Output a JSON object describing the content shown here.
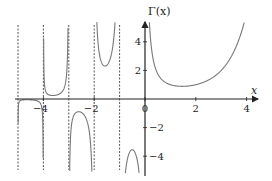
{
  "chart_data": {
    "type": "line",
    "title": "",
    "function": "Gamma function",
    "xlabel": "x",
    "ylabel": "Γ(x)",
    "x_ticks": [
      -4,
      -2,
      0,
      2,
      4
    ],
    "x_tick_labels": [
      "−4",
      "−2",
      "0",
      "2",
      "4"
    ],
    "y_ticks": [
      4,
      2,
      -2,
      -4
    ],
    "y_tick_labels": [
      "4",
      "2",
      "−2",
      "−4"
    ],
    "xlim": [
      -5,
      4.4
    ],
    "ylim": [
      -5,
      5.5
    ],
    "grid": false,
    "legend": null,
    "asymptotes_x": [
      -5,
      -4,
      -3,
      -2,
      -1
    ],
    "series": [
      {
        "name": "Γ(x), x > 0",
        "points": [
          [
            0.2,
            4.59
          ],
          [
            0.3,
            2.99
          ],
          [
            0.5,
            1.77
          ],
          [
            1.0,
            1.0
          ],
          [
            1.46,
            0.886
          ],
          [
            2.0,
            1.0
          ],
          [
            3.0,
            2.0
          ],
          [
            3.5,
            3.32
          ],
          [
            4.0,
            6.0
          ]
        ]
      },
      {
        "name": "Γ(x), -1 < x < 0",
        "points": [
          [
            -0.2,
            -5.82
          ],
          [
            -0.3,
            -4.33
          ],
          [
            -0.5,
            -3.54
          ],
          [
            -0.7,
            -4.27
          ],
          [
            -0.85,
            -7.0
          ]
        ]
      },
      {
        "name": "Γ(x), -2 < x < -1",
        "points": [
          [
            -1.1,
            9.71
          ],
          [
            -1.3,
            4.3
          ],
          [
            -1.5,
            2.36
          ],
          [
            -1.7,
            2.77
          ],
          [
            -1.9,
            9.5
          ]
        ]
      },
      {
        "name": "Γ(x), -3 < x < -2",
        "points": [
          [
            -2.1,
            -4.62
          ],
          [
            -2.3,
            -1.45
          ],
          [
            -2.5,
            -0.945
          ],
          [
            -2.7,
            -1.02
          ],
          [
            -2.9,
            -3.3
          ]
        ]
      },
      {
        "name": "Γ(x), -4 < x < -3",
        "points": [
          [
            -3.1,
            1.49
          ],
          [
            -3.3,
            0.44
          ],
          [
            -3.5,
            0.27
          ],
          [
            -3.7,
            0.28
          ],
          [
            -3.9,
            0.83
          ]
        ]
      },
      {
        "name": "Γ(x), -5 < x < -4",
        "points": [
          [
            -4.1,
            -0.36
          ],
          [
            -4.3,
            -0.1
          ],
          [
            -4.5,
            -0.06
          ],
          [
            -4.7,
            -0.06
          ],
          [
            -4.9,
            -0.17
          ]
        ]
      }
    ]
  }
}
